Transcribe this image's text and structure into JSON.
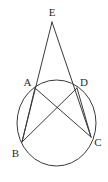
{
  "figure": {
    "kind": "geometry-diagram",
    "background_color": "#ffffff",
    "stroke_color": "#3a3a3a",
    "label_color": "#2b2b2b",
    "stroke_width": 1,
    "canvas": {
      "width": 108,
      "height": 182
    },
    "circle": {
      "name": "circumscribed-circle",
      "cx": 56.5,
      "cy": 123,
      "rx": 39.5,
      "ry": 43
    },
    "points": [
      {
        "id": "E",
        "label": "E",
        "x": 52,
        "y": 22,
        "label_x": 52,
        "label_y": 16
      },
      {
        "id": "A",
        "label": "A",
        "x": 35,
        "y": 88,
        "label_x": 27.5,
        "label_y": 86
      },
      {
        "id": "D",
        "label": "D",
        "x": 77,
        "y": 88,
        "label_x": 84,
        "label_y": 86
      },
      {
        "id": "B",
        "label": "B",
        "x": 22,
        "y": 142,
        "label_x": 15.5,
        "label_y": 157
      },
      {
        "id": "C",
        "label": "C",
        "x": 91,
        "y": 137,
        "label_x": 98,
        "label_y": 146
      }
    ],
    "segments": [
      {
        "id": "EB",
        "name": "secant-e-through-a-to-b",
        "from": "E",
        "to": "B"
      },
      {
        "id": "EC",
        "name": "secant-e-through-d-to-c",
        "from": "E",
        "to": "C"
      },
      {
        "id": "AC",
        "name": "chord-a-c",
        "from": "A",
        "to": "C"
      },
      {
        "id": "BD",
        "name": "chord-b-d",
        "from": "B",
        "to": "D"
      },
      {
        "id": "AB",
        "name": "chord-a-b",
        "from": "A",
        "to": "B"
      },
      {
        "id": "DC",
        "name": "chord-d-c",
        "from": "D",
        "to": "C"
      }
    ]
  }
}
